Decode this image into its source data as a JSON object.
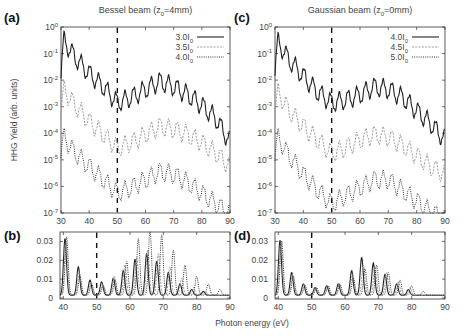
{
  "figure": {
    "ylabel_top": "HHG Yield (arb. units)",
    "xlabel": "Photon energy (eV)"
  },
  "chart_data": [
    {
      "panel": "(a)",
      "type": "line",
      "title": "Bessel beam (z0=4mm)",
      "title_main": "Bessel beam (z",
      "title_sub": "0",
      "title_end": "=4mm)",
      "xlabel": "Photon energy (eV)",
      "ylabel": "HHG Yield (arb. units)",
      "yscale": "log",
      "xlim": [
        30,
        90
      ],
      "ylim": [
        1e-07,
        1
      ],
      "xticks": [
        "30",
        "40",
        "50",
        "60",
        "70",
        "80",
        "90"
      ],
      "yticks": [
        "10^0",
        "10^-1",
        "10^-2",
        "10^-3",
        "10^-4",
        "10^-5",
        "10^-6",
        "10^-7"
      ],
      "vline": 50,
      "legend": [
        {
          "name": "3.0I0",
          "label": "3.0I",
          "sub": "0",
          "style": "solid",
          "color": "#222222"
        },
        {
          "name": "3.5I0",
          "label": "3.5I",
          "sub": "0",
          "style": "dashed",
          "color": "#aaaaaa"
        },
        {
          "name": "4.0I0",
          "label": "4.0I",
          "sub": "0",
          "style": "dotted",
          "color": "#333333"
        }
      ],
      "series": [
        {
          "name": "3.0I0",
          "envelope_x": [
            30,
            31,
            35,
            40,
            45,
            50,
            55,
            60,
            65,
            70,
            75,
            80,
            85,
            90
          ],
          "envelope_log10": [
            -1.5,
            -0.25,
            -0.9,
            -1.5,
            -2.0,
            -2.6,
            -2.4,
            -2.1,
            -1.8,
            -2.0,
            -2.3,
            -2.7,
            -3.2,
            -4.1
          ]
        },
        {
          "name": "3.5I0",
          "envelope_x": [
            30,
            31,
            35,
            40,
            45,
            50,
            55,
            60,
            65,
            70,
            75,
            80,
            85,
            90
          ],
          "envelope_log10": [
            -3.0,
            -2.1,
            -2.7,
            -3.3,
            -3.8,
            -4.3,
            -4.1,
            -3.8,
            -3.5,
            -3.6,
            -3.8,
            -4.1,
            -4.5,
            -5.0
          ]
        },
        {
          "name": "4.0I0",
          "envelope_x": [
            30,
            31,
            35,
            40,
            45,
            50,
            55,
            60,
            65,
            70,
            75,
            80,
            85,
            90
          ],
          "envelope_log10": [
            -4.5,
            -3.9,
            -4.5,
            -5.0,
            -5.5,
            -6.0,
            -5.8,
            -5.5,
            -5.2,
            -5.3,
            -5.6,
            -6.0,
            -6.4,
            -6.8
          ]
        }
      ]
    },
    {
      "panel": "(c)",
      "type": "line",
      "title": "Gaussian beam (z0=0mm)",
      "title_main": "Gaussian beam (z",
      "title_sub": "0",
      "title_end": "=0mm)",
      "xlabel": "Photon energy (eV)",
      "yscale": "log",
      "xlim": [
        30,
        90
      ],
      "ylim": [
        1e-07,
        1
      ],
      "xticks": [
        "30",
        "40",
        "50",
        "60",
        "70",
        "80",
        "90"
      ],
      "yticks": [
        "10^0",
        "10^-1",
        "10^-2",
        "10^-3",
        "10^-4",
        "10^-5",
        "10^-6",
        "10^-7"
      ],
      "vline": 50,
      "legend": [
        {
          "name": "4.0I0",
          "label": "4.0I",
          "sub": "0",
          "style": "solid",
          "color": "#222222"
        },
        {
          "name": "4.5I0",
          "label": "4.5I",
          "sub": "0",
          "style": "dashed",
          "color": "#aaaaaa"
        },
        {
          "name": "5.0I0",
          "label": "5.0I",
          "sub": "0",
          "style": "dotted",
          "color": "#333333"
        }
      ],
      "series": [
        {
          "name": "4.0I0",
          "envelope_x": [
            30,
            31,
            35,
            40,
            45,
            50,
            55,
            60,
            65,
            70,
            75,
            80,
            85,
            90
          ],
          "envelope_log10": [
            -1.4,
            -0.3,
            -1.0,
            -1.6,
            -2.2,
            -2.6,
            -2.5,
            -2.3,
            -2.0,
            -2.1,
            -2.4,
            -2.9,
            -3.4,
            -4.0
          ]
        },
        {
          "name": "4.5I0",
          "envelope_x": [
            30,
            31,
            35,
            40,
            45,
            50,
            55,
            60,
            65,
            70,
            75,
            80,
            85,
            90
          ],
          "envelope_log10": [
            -3.0,
            -2.2,
            -2.9,
            -3.5,
            -4.0,
            -4.5,
            -4.3,
            -4.0,
            -3.8,
            -3.9,
            -4.2,
            -4.6,
            -5.0,
            -5.3
          ]
        },
        {
          "name": "5.0I0",
          "envelope_x": [
            30,
            31,
            35,
            40,
            45,
            50,
            55,
            60,
            65,
            70,
            75,
            80,
            85,
            90
          ],
          "envelope_log10": [
            -4.6,
            -3.9,
            -4.6,
            -5.3,
            -5.9,
            -6.4,
            -6.1,
            -5.8,
            -5.5,
            -5.5,
            -5.9,
            -6.3,
            -6.7,
            -7.0
          ]
        }
      ]
    },
    {
      "panel": "(b)",
      "type": "line",
      "title": "",
      "xlabel": "Photon energy (eV)",
      "yscale": "linear",
      "xlim": [
        39,
        90
      ],
      "ylim": [
        0,
        0.035
      ],
      "xticks": [
        "40",
        "50",
        "60",
        "70",
        "80",
        "90"
      ],
      "yticks": [
        "0",
        "0.01",
        "0.02",
        "0.03"
      ],
      "vline": 50,
      "series": [
        {
          "name": "3.0I0",
          "style": "solid",
          "peaks_x": [
            40.5,
            44.5,
            48,
            51.5,
            55,
            58,
            61.5,
            65,
            68,
            71.5,
            75,
            78.5,
            82
          ],
          "peaks_y": [
            0.03,
            0.015,
            0.008,
            0.007,
            0.009,
            0.013,
            0.019,
            0.022,
            0.018,
            0.012,
            0.006,
            0.003,
            0.002
          ]
        },
        {
          "name": "3.5I0",
          "style": "dashed",
          "peaks_x": [
            40.8,
            44.8,
            48.3,
            51.8,
            55.3,
            58.5,
            62,
            65.3,
            68.5,
            72,
            75.5,
            79,
            82.5
          ],
          "peaks_y": [
            0.028,
            0.012,
            0.007,
            0.006,
            0.01,
            0.016,
            0.02,
            0.024,
            0.022,
            0.015,
            0.009,
            0.004,
            0.002
          ]
        },
        {
          "name": "4.0I0",
          "style": "dotted",
          "peaks_x": [
            41,
            45,
            48.5,
            52,
            55.5,
            59,
            62.5,
            66,
            69.5,
            73,
            76.5,
            80,
            83.5,
            87
          ],
          "peaks_y": [
            0.031,
            0.01,
            0.006,
            0.005,
            0.008,
            0.018,
            0.03,
            0.035,
            0.032,
            0.024,
            0.016,
            0.01,
            0.006,
            0.003
          ]
        }
      ]
    },
    {
      "panel": "(d)",
      "type": "line",
      "title": "",
      "xlabel": "Photon energy (eV)",
      "yscale": "linear",
      "xlim": [
        39,
        90
      ],
      "ylim": [
        0,
        0.035
      ],
      "xticks": [
        "40",
        "50",
        "60",
        "70",
        "80",
        "90"
      ],
      "yticks": [
        "0",
        "0.01",
        "0.02",
        "0.03"
      ],
      "vline": 50,
      "series": [
        {
          "name": "4.0I0",
          "style": "solid",
          "peaks_x": [
            40.5,
            44,
            47.5,
            51,
            54.5,
            58,
            62,
            65,
            68.5,
            72,
            75.5,
            79
          ],
          "peaks_y": [
            0.029,
            0.012,
            0.006,
            0.004,
            0.005,
            0.006,
            0.013,
            0.02,
            0.017,
            0.011,
            0.006,
            0.003
          ]
        },
        {
          "name": "4.5I0",
          "style": "dashed",
          "peaks_x": [
            40.8,
            44.3,
            47.8,
            51.3,
            54.8,
            58.3,
            62.3,
            65.5,
            69,
            72.5,
            76,
            79.5
          ],
          "peaks_y": [
            0.028,
            0.011,
            0.006,
            0.004,
            0.005,
            0.006,
            0.011,
            0.016,
            0.015,
            0.012,
            0.007,
            0.004
          ]
        },
        {
          "name": "5.0I0",
          "style": "dotted",
          "peaks_x": [
            41,
            44.5,
            48,
            51.5,
            55,
            58.5,
            62.5,
            66,
            69.5,
            73,
            76.5,
            80,
            83.5
          ],
          "peaks_y": [
            0.029,
            0.01,
            0.005,
            0.004,
            0.005,
            0.006,
            0.009,
            0.014,
            0.016,
            0.012,
            0.008,
            0.005,
            0.002
          ]
        }
      ]
    }
  ]
}
